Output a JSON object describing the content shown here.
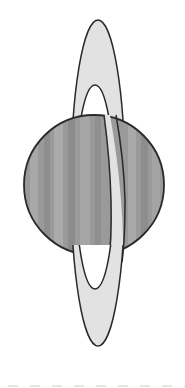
{
  "illustration": {
    "subject": "planet-with-vertical-ring",
    "colors": {
      "background": "#ffffff",
      "planet_fill": "#9a9a9a",
      "planet_band_light": "#adadad",
      "planet_band_dark": "#8c8c8c",
      "ring_fill": "#e2e2e2",
      "outline": "#2a2a2a",
      "dash": "#e6e6e6"
    }
  }
}
